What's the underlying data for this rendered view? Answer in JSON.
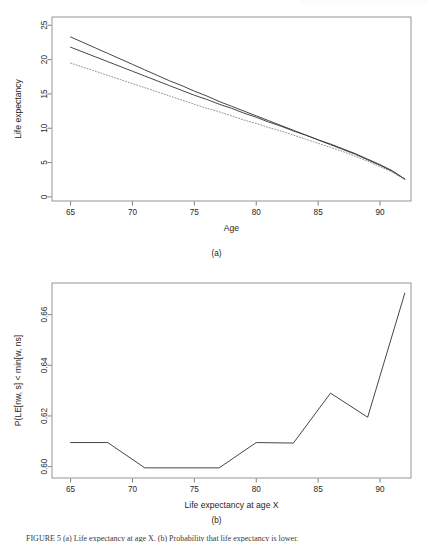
{
  "document": {
    "figure_label": "FIGURE 5",
    "figure_caption": "FIGURE 5   (a) Life expectancy at age X. (b) Probability that life expectancy is lower.",
    "header_strip": ""
  },
  "panels": [
    {
      "id": "a",
      "caption": "(a)"
    },
    {
      "id": "b",
      "caption": "(b)"
    }
  ],
  "chart_data": [
    {
      "type": "line",
      "panel": "a",
      "title": "",
      "subtitle": "(a)",
      "xlabel": "Age",
      "ylabel": "Life expectancy",
      "xlim": [
        63.5,
        92.5
      ],
      "ylim": [
        -0.6,
        26.2
      ],
      "xticks": [
        65,
        70,
        75,
        80,
        85,
        90
      ],
      "yticks": [
        0,
        5,
        10,
        15,
        20,
        25
      ],
      "xtick_labels": [
        "65",
        "70",
        "75",
        "80",
        "85",
        "90"
      ],
      "ytick_labels": [
        "0",
        "5",
        "10",
        "15",
        "20",
        "25"
      ],
      "grid": false,
      "legend": "none",
      "box": true,
      "x": [
        65,
        66,
        67,
        68,
        69,
        70,
        71,
        72,
        73,
        74,
        75,
        76,
        77,
        78,
        79,
        80,
        81,
        82,
        83,
        84,
        85,
        86,
        87,
        88,
        89,
        90,
        91,
        92
      ],
      "series": [
        {
          "name": "upper-solid",
          "style": "solid",
          "color": "#3c3c3c",
          "values": [
            23.3,
            22.5,
            21.7,
            20.9,
            20.1,
            19.3,
            18.5,
            17.7,
            16.9,
            16.2,
            15.4,
            14.7,
            13.9,
            13.2,
            12.5,
            11.8,
            11.1,
            10.4,
            9.7,
            9.0,
            8.3,
            7.6,
            6.9,
            6.2,
            5.4,
            4.6,
            3.7,
            2.6
          ]
        },
        {
          "name": "lower-solid",
          "style": "solid",
          "color": "#3c3c3c",
          "values": [
            21.8,
            21.1,
            20.4,
            19.7,
            19.0,
            18.3,
            17.6,
            16.9,
            16.2,
            15.5,
            14.8,
            14.2,
            13.5,
            12.9,
            12.2,
            11.6,
            10.9,
            10.3,
            9.6,
            9.0,
            8.3,
            7.7,
            7.0,
            6.3,
            5.5,
            4.7,
            3.8,
            2.6
          ]
        },
        {
          "name": "dotted",
          "style": "dotted",
          "color": "#8c8c8c",
          "values": [
            19.5,
            18.9,
            18.3,
            17.7,
            17.1,
            16.5,
            15.9,
            15.3,
            14.7,
            14.1,
            13.5,
            12.9,
            12.4,
            11.8,
            11.2,
            10.7,
            10.1,
            9.6,
            9.0,
            8.4,
            7.8,
            7.2,
            6.6,
            5.9,
            5.2,
            4.4,
            3.6,
            2.5
          ]
        }
      ]
    },
    {
      "type": "line",
      "panel": "b",
      "title": "",
      "subtitle": "(b)",
      "xlabel": "Life expectancy at age X",
      "ylabel": "P(LE[nw, s] < min[w, ns]",
      "xlim": [
        63.5,
        92.5
      ],
      "ylim": [
        0.5955,
        0.6725
      ],
      "xticks": [
        65,
        70,
        75,
        80,
        85,
        90
      ],
      "yticks": [
        0.6,
        0.62,
        0.64,
        0.66
      ],
      "xtick_labels": [
        "65",
        "70",
        "75",
        "80",
        "85",
        "90"
      ],
      "ytick_labels": [
        "0.60",
        "0.62",
        "0.64",
        "0.66"
      ],
      "grid": false,
      "legend": "none",
      "box": true,
      "x": [
        65,
        68,
        71,
        77,
        80,
        83,
        86,
        89,
        92
      ],
      "values": [
        0.6095,
        0.6095,
        0.5995,
        0.5995,
        0.6095,
        0.6093,
        0.629,
        0.6195,
        0.6685
      ],
      "series": [
        {
          "name": "probability",
          "style": "solid",
          "color": "#3c3c3c",
          "values": [
            0.6095,
            0.6095,
            0.5995,
            0.5995,
            0.6095,
            0.6093,
            0.629,
            0.6195,
            0.6685
          ]
        }
      ]
    }
  ]
}
